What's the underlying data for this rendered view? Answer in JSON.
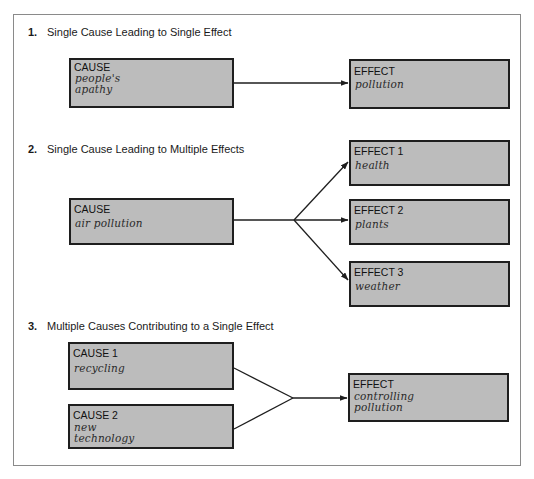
{
  "sections": [
    {
      "number": "1.",
      "title": "Single Cause Leading to Single Effect",
      "causes": [
        {
          "label": "CAUSE",
          "value_lines": [
            "people's",
            "apathy"
          ]
        }
      ],
      "effects": [
        {
          "label": "EFFECT",
          "value_lines": [
            "pollution"
          ]
        }
      ]
    },
    {
      "number": "2.",
      "title": "Single Cause Leading to Multiple Effects",
      "causes": [
        {
          "label": "CAUSE",
          "value_lines": [
            "air pollution"
          ]
        }
      ],
      "effects": [
        {
          "label": "EFFECT 1",
          "value_lines": [
            "health"
          ]
        },
        {
          "label": "EFFECT 2",
          "value_lines": [
            "plants"
          ]
        },
        {
          "label": "EFFECT 3",
          "value_lines": [
            "weather"
          ]
        }
      ]
    },
    {
      "number": "3.",
      "title": "Multiple Causes Contributing to a Single Effect",
      "causes": [
        {
          "label": "CAUSE 1",
          "value_lines": [
            "recycling"
          ]
        },
        {
          "label": "CAUSE 2",
          "value_lines": [
            "new",
            "technology"
          ]
        }
      ],
      "effects": [
        {
          "label": "EFFECT",
          "value_lines": [
            "controlling",
            "pollution"
          ]
        }
      ]
    }
  ],
  "colors": {
    "box_fill": "#bcbcbc",
    "box_border": "#1e1e1e",
    "connector": "#1e1e1e",
    "frame_border": "#8a8a8a"
  }
}
